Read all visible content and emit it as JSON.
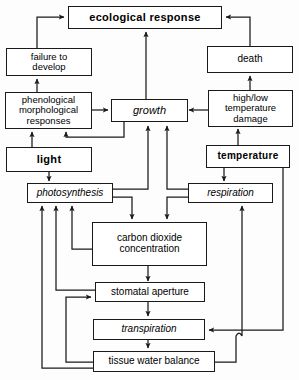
{
  "figure": {
    "kind": "flow-diagram",
    "title": "",
    "background_color": "#fdfdfd",
    "line_color": "#1a1a1a",
    "box_fill": "#ffffff"
  },
  "nodes": {
    "ecological_response": {
      "label": "ecological  response",
      "style": "bold"
    },
    "failure_to_develop": {
      "label": "failure  to\ndevelop",
      "style": "plain"
    },
    "death": {
      "label": "death",
      "style": "plain"
    },
    "phenological_morphological_responses": {
      "label": "phenological\nmorphological\nresponses",
      "style": "plain"
    },
    "growth": {
      "label": "growth",
      "style": "italic"
    },
    "high_low_temperature_damage": {
      "label": "high/low\ntemperature\ndamage",
      "style": "plain"
    },
    "light": {
      "label": "light",
      "style": "bold"
    },
    "temperature": {
      "label": "temperature",
      "style": "bold"
    },
    "photosynthesis": {
      "label": "photosynthesis",
      "style": "italic"
    },
    "respiration": {
      "label": "respiration",
      "style": "italic"
    },
    "carbon_dioxide_concentration": {
      "label": "carbon  dioxide\nconcentration",
      "style": "plain"
    },
    "stomatal_aperture": {
      "label": "stomatal  aperture",
      "style": "plain"
    },
    "transpiration": {
      "label": "transpiration",
      "style": "italic"
    },
    "tissue_water_balance": {
      "label": "tissue  water  balance",
      "style": "plain"
    }
  },
  "edges": [
    {
      "from": "failure_to_develop",
      "to": "ecological_response"
    },
    {
      "from": "death",
      "to": "ecological_response"
    },
    {
      "from": "growth",
      "to": "ecological_response"
    },
    {
      "from": "phenological_morphological_responses",
      "to": "failure_to_develop"
    },
    {
      "from": "high_low_temperature_damage",
      "to": "death"
    },
    {
      "from": "phenological_morphological_responses",
      "to": "growth"
    },
    {
      "from": "high_low_temperature_damage",
      "to": "growth"
    },
    {
      "from": "light",
      "to": "phenological_morphological_responses"
    },
    {
      "from": "growth",
      "to": "phenological_morphological_responses"
    },
    {
      "from": "temperature",
      "to": "high_low_temperature_damage"
    },
    {
      "from": "light",
      "to": "photosynthesis"
    },
    {
      "from": "temperature",
      "to": "respiration"
    },
    {
      "from": "photosynthesis",
      "to": "growth"
    },
    {
      "from": "respiration",
      "to": "growth"
    },
    {
      "from": "photosynthesis",
      "to": "carbon_dioxide_concentration"
    },
    {
      "from": "respiration",
      "to": "carbon_dioxide_concentration"
    },
    {
      "from": "carbon_dioxide_concentration",
      "to": "stomatal_aperture"
    },
    {
      "from": "carbon_dioxide_concentration",
      "to": "photosynthesis"
    },
    {
      "from": "stomatal_aperture",
      "to": "photosynthesis"
    },
    {
      "from": "stomatal_aperture",
      "to": "transpiration"
    },
    {
      "from": "transpiration",
      "to": "tissue_water_balance"
    },
    {
      "from": "tissue_water_balance",
      "to": "stomatal_aperture"
    },
    {
      "from": "tissue_water_balance",
      "to": "photosynthesis"
    },
    {
      "from": "tissue_water_balance",
      "to": "respiration"
    },
    {
      "from": "temperature",
      "to": "transpiration"
    }
  ]
}
